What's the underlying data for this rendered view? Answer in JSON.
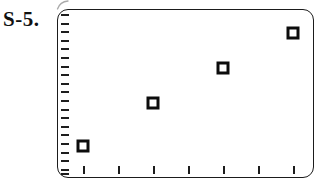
{
  "page": {
    "background_color": "#ffffff",
    "width": 319,
    "height": 186
  },
  "figure": {
    "label": "S-5.",
    "label_color": "#111111"
  },
  "artifact": {
    "name": "scan-smudge-mark",
    "description": "faint curved pen/scan mark above top-left corner of plot frame",
    "color": "#8a8a8a"
  },
  "plot": {
    "frame_color": "#1b1b1b",
    "frame_radius_px": 11,
    "tick_color": "#1d1d1d",
    "marker_edge_color": "#0c0c0c",
    "marker_fill_color": "#ffffff"
  },
  "chart_data": {
    "type": "scatter",
    "title": "",
    "subtitle": "",
    "xlabel": "",
    "ylabel": "",
    "x": [
      1,
      2,
      3,
      4
    ],
    "y": [
      2,
      7,
      11.5,
      15.5
    ],
    "xlim": [
      0.5,
      7.0
    ],
    "ylim": [
      0,
      19
    ],
    "grid": false,
    "legend": null,
    "legend_position": "none",
    "x_tick_labels": [
      "",
      "",
      "",
      "",
      "",
      "",
      ""
    ],
    "y_tick_labels": [],
    "x_tick_count": 7,
    "y_tick_count": 20,
    "x_ticks_px": [
      25,
      60,
      95,
      130,
      165,
      200,
      235
    ],
    "y_ticks_px": [
      4,
      12.6,
      21.2,
      29.8,
      38.4,
      47,
      55.6,
      64.2,
      72.8,
      81.4,
      90,
      98.6,
      107.2,
      115.8,
      124.4,
      133,
      141.6,
      150.2,
      158.8,
      163
    ],
    "points_px": [
      {
        "x": 25,
        "y": 136
      },
      {
        "x": 95,
        "y": 93
      },
      {
        "x": 165,
        "y": 58
      },
      {
        "x": 235,
        "y": 23
      }
    ],
    "marker": "open-square",
    "marker_size_px": 13,
    "series": [
      {
        "name": "data",
        "values": [
          2,
          7,
          11.5,
          15.5
        ]
      }
    ],
    "annotations": []
  }
}
